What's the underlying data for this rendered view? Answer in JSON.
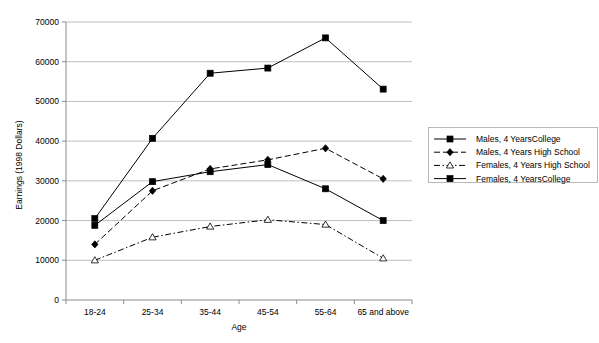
{
  "chart_data": {
    "type": "line",
    "title": "",
    "xlabel": "Age",
    "ylabel": "Earnings (1998 Dollars)",
    "categories": [
      "18-24",
      "25-34",
      "35-44",
      "45-54",
      "55-64",
      "65 and above"
    ],
    "ylim": [
      0,
      70000
    ],
    "ytick_step": 10000,
    "yticks": [
      "0",
      "10000",
      "20000",
      "30000",
      "40000",
      "50000",
      "60000",
      "70000"
    ],
    "grid": true,
    "legend_position": "right",
    "series": [
      {
        "name": "Males, 4 YearsCollege",
        "values": [
          18800,
          29800,
          32300,
          34100,
          28000,
          20000
        ],
        "marker": "filled-square",
        "linestyle": "solid"
      },
      {
        "name": "Males, 4 Years High School",
        "values": [
          14000,
          27500,
          33000,
          35300,
          38200,
          30500
        ],
        "marker": "filled-diamond",
        "linestyle": "dashed"
      },
      {
        "name": "Females, 4 Years High School",
        "values": [
          10000,
          15800,
          18500,
          20200,
          19000,
          10500
        ],
        "marker": "open-triangle",
        "linestyle": "dash-dot"
      },
      {
        "name": "Females, 4 YearsCollege",
        "values": [
          20500,
          40700,
          57100,
          58400,
          66000,
          53100
        ],
        "marker": "filled-square",
        "linestyle": "solid"
      }
    ]
  },
  "colors": {
    "line": "#000000",
    "grid": "#b0b0b0",
    "axis": "#808080",
    "legend_border": "#a8a8a8",
    "background": "#ffffff"
  },
  "legend": {
    "items": [
      {
        "label": "Males, 4 YearsCollege"
      },
      {
        "label": "Males, 4 Years High School"
      },
      {
        "label": "Females, 4 Years High School"
      },
      {
        "label": "Females, 4 YearsCollege"
      }
    ]
  }
}
